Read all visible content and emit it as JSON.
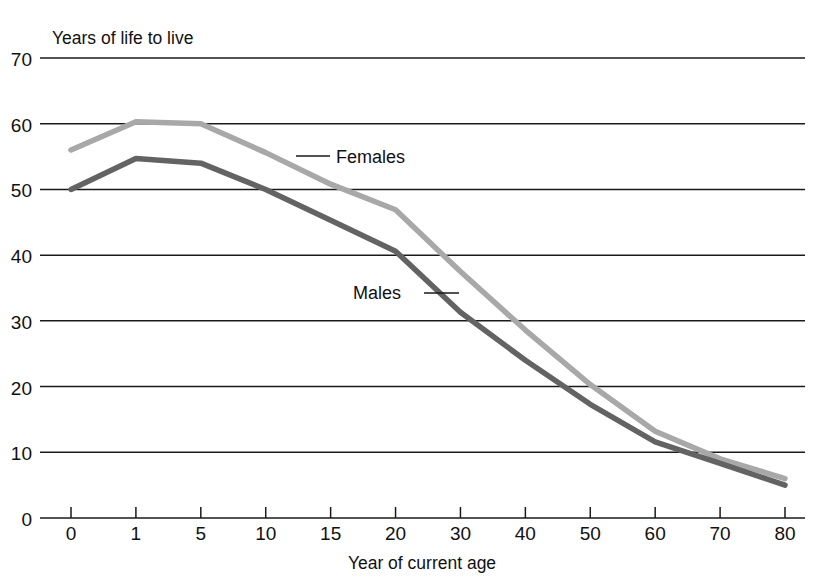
{
  "chart_data": {
    "type": "line",
    "title": "",
    "ylabel": "Years of life to live",
    "xlabel": "Year of current age",
    "grid": true,
    "legend_position": "inline-annotations",
    "categories": [
      "0",
      "1",
      "5",
      "10",
      "15",
      "20",
      "30",
      "40",
      "50",
      "60",
      "70",
      "80"
    ],
    "x_tick_labels": [
      "0",
      "1",
      "5",
      "10",
      "15",
      "20",
      "30",
      "40",
      "50",
      "60",
      "70",
      "80"
    ],
    "y_tick_labels": [
      "0",
      "10",
      "20",
      "30",
      "40",
      "50",
      "60",
      "70"
    ],
    "ylim": [
      0,
      70
    ],
    "y_ticks": [
      0,
      10,
      20,
      30,
      40,
      50,
      60,
      70
    ],
    "axis_note": "x axis is categorical: ticks evenly spaced although ages are uneven",
    "series": [
      {
        "name": "Females",
        "color": "#a8a8a8",
        "values": [
          56.0,
          60.3,
          60.0,
          55.6,
          50.8,
          46.9,
          37.5,
          28.6,
          20.3,
          13.2,
          9.0,
          6.0
        ]
      },
      {
        "name": "Males",
        "color": "#636363",
        "values": [
          50.0,
          54.7,
          54.0,
          50.0,
          45.3,
          40.6,
          31.3,
          24.0,
          17.3,
          11.6,
          8.3,
          5.0
        ]
      }
    ],
    "annotations": [
      {
        "text": "Females",
        "series": "Females",
        "anchor_category": "15"
      },
      {
        "text": "Males",
        "series": "Males",
        "anchor_category": "20"
      }
    ]
  },
  "labels": {
    "y_axis_title": "Years of life to live",
    "x_axis_title": "Year of current age",
    "females": "Females",
    "males": "Males"
  }
}
